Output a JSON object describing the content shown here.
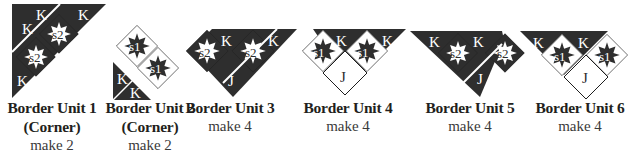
{
  "colors": {
    "dark": "#2e2e2e",
    "light": "#ffffff",
    "outline": "#1e1e1e",
    "text_on_dark": "#ffffff",
    "text_on_light": "#2e2e2e",
    "caption": "#231f20"
  },
  "units": [
    {
      "title": "Border Unit 1",
      "subtitle": "(Corner)",
      "make": "make 2",
      "pieces": [
        "K",
        "K",
        "K",
        "s2",
        "s2"
      ]
    },
    {
      "title": "Border Unit 2",
      "subtitle": "(Corner)",
      "make": "make 2",
      "pieces": [
        "s1",
        "s1",
        "K",
        "K"
      ]
    },
    {
      "title": "Border Unit 3",
      "subtitle": "",
      "make": "make 4",
      "pieces": [
        "s2",
        "K",
        "s2",
        "K",
        "J"
      ]
    },
    {
      "title": "Border Unit 4",
      "subtitle": "",
      "make": "make 4",
      "pieces": [
        "s1",
        "K",
        "s1",
        "K",
        "J"
      ]
    },
    {
      "title": "Border Unit 5",
      "subtitle": "",
      "make": "make 4",
      "pieces": [
        "K",
        "s2",
        "K",
        "s2",
        "J"
      ]
    },
    {
      "title": "Border Unit 6",
      "subtitle": "",
      "make": "make 4",
      "pieces": [
        "K",
        "s1",
        "K",
        "s1",
        "J"
      ]
    }
  ],
  "labels": {
    "K": "K",
    "J": "J",
    "s1": "s1",
    "s2": "s2"
  }
}
